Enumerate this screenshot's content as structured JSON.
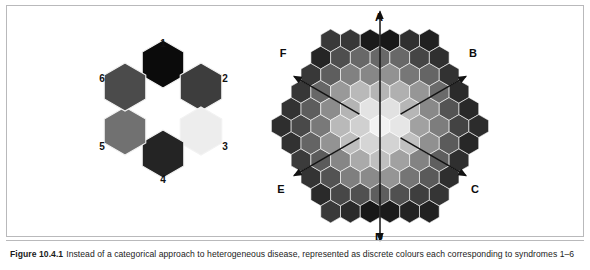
{
  "figure": {
    "caption_label": "Figure 10.4.1",
    "caption_text": "Instead of a categorical approach to heterogeneous disease, represented as discrete colours each corresponding to syndromes 1–6"
  },
  "left_diagram": {
    "name": "categorical-syndrome-ring",
    "description": "Six discrete hexagons arranged in a ring, each a distinct grey tone, labelled 1 to 6",
    "cells": [
      {
        "label": "1",
        "color": "#0b0b0b",
        "position": "top",
        "cx": 66,
        "cy": 30,
        "label_x": 66,
        "label_y": 10
      },
      {
        "label": "2",
        "color": "#3d3d3d",
        "position": "upper-right",
        "cx": 104,
        "cy": 53,
        "label_x": 128,
        "label_y": 45
      },
      {
        "label": "3",
        "color": "#ededed",
        "position": "lower-right",
        "cx": 104,
        "cy": 97,
        "label_x": 128,
        "label_y": 113
      },
      {
        "label": "4",
        "color": "#242424",
        "position": "bottom",
        "cx": 66,
        "cy": 120,
        "label_x": 66,
        "label_y": 146
      },
      {
        "label": "5",
        "color": "#717171",
        "position": "lower-left",
        "cx": 28,
        "cy": 97,
        "label_x": 5,
        "label_y": 113
      },
      {
        "label": "6",
        "color": "#4b4b4b",
        "position": "upper-left",
        "cx": 28,
        "cy": 53,
        "label_x": 5,
        "label_y": 45
      }
    ]
  },
  "right_diagram": {
    "name": "continuous-syndrome-space",
    "description": "Hexagonal honeycomb field with a radial greyscale gradient, lightest at the centre and darkest at the rim, with six labelled axes radiating outward",
    "axes": [
      {
        "label": "A",
        "direction": "up",
        "label_x": 102,
        "label_y": 12
      },
      {
        "label": "B",
        "direction": "upper-right",
        "label_x": 196,
        "label_y": 48
      },
      {
        "label": "C",
        "direction": "lower-right",
        "label_x": 198,
        "label_y": 184
      },
      {
        "label": "D",
        "direction": "down",
        "label_x": 102,
        "label_y": 232
      },
      {
        "label": "E",
        "direction": "lower-left",
        "label_x": 4,
        "label_y": 184
      },
      {
        "label": "F",
        "direction": "upper-left",
        "label_x": 6,
        "label_y": 48
      }
    ],
    "gradient": {
      "centre_color": "#ffffff",
      "rim_color": "#3a3a3a",
      "darkest_accent_color": "#141414",
      "rings": 5
    }
  }
}
